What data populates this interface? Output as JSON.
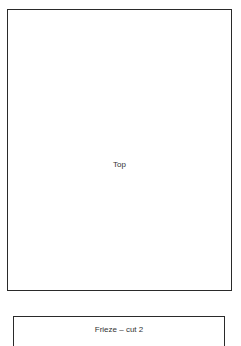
{
  "diagram": {
    "panels": [
      {
        "id": "top",
        "label": "Top"
      },
      {
        "id": "frieze",
        "label": "Frieze  –  cut 2"
      }
    ]
  }
}
